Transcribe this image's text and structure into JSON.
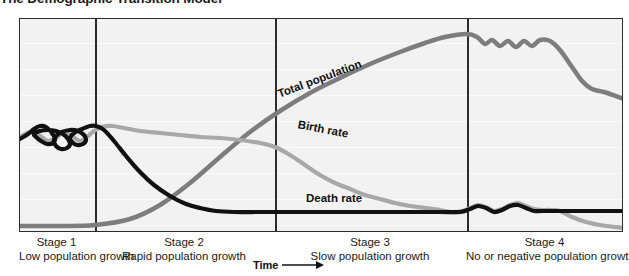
{
  "title": "The Demographic Transition Model",
  "axis": {
    "x_label": "Time",
    "x_arrow_icon": "right-arrow-icon"
  },
  "curve_labels": {
    "total_population": "Total population",
    "birth_rate": "Birth rate",
    "death_rate": "Death rate"
  },
  "stages": [
    {
      "name": "Stage 1",
      "description": "Low population growth"
    },
    {
      "name": "Stage 2",
      "description": "Rapid population growth"
    },
    {
      "name": "Stage 3",
      "description": "Slow population growth"
    },
    {
      "name": "Stage 4",
      "description": "No or negative population growth"
    }
  ],
  "colors": {
    "total_population": "#7d7d7d",
    "birth_rate": "#a8a8a8",
    "death_rate": "#111111",
    "plot_background": "#f2f2f2",
    "frame": "#2b2b2b",
    "gridline": "#fbfbfb"
  },
  "chart_data": {
    "type": "line",
    "title": "The Demographic Transition Model",
    "xlabel": "Time",
    "ylabel": "",
    "grid": true,
    "legend": "inline-curve-labels",
    "xlim": [
      0,
      604
    ],
    "ylim": [
      214,
      0
    ],
    "stage_boundaries_px": [
      75,
      255,
      447
    ],
    "series": [
      {
        "name": "Total population",
        "color": "#7d7d7d",
        "width": 4.5,
        "points": [
          [
            0,
            207
          ],
          [
            40,
            207
          ],
          [
            75,
            206
          ],
          [
            110,
            200
          ],
          [
            140,
            186
          ],
          [
            170,
            164
          ],
          [
            200,
            138
          ],
          [
            230,
            113
          ],
          [
            260,
            92
          ],
          [
            290,
            74
          ],
          [
            320,
            59
          ],
          [
            350,
            45
          ],
          [
            380,
            33
          ],
          [
            405,
            24
          ],
          [
            425,
            18
          ],
          [
            447,
            15
          ],
          [
            457,
            18
          ],
          [
            465,
            25
          ],
          [
            472,
            21
          ],
          [
            480,
            27
          ],
          [
            488,
            22
          ],
          [
            496,
            28
          ],
          [
            504,
            22
          ],
          [
            512,
            27
          ],
          [
            520,
            21
          ],
          [
            530,
            22
          ],
          [
            540,
            31
          ],
          [
            552,
            48
          ],
          [
            562,
            62
          ],
          [
            572,
            70
          ],
          [
            584,
            73
          ],
          [
            604,
            80
          ]
        ]
      },
      {
        "name": "Birth rate",
        "color": "#a8a8a8",
        "width": 4.2,
        "points": [
          [
            0,
            118
          ],
          [
            10,
            113
          ],
          [
            20,
            117
          ],
          [
            28,
            122
          ],
          [
            36,
            119
          ],
          [
            44,
            113
          ],
          [
            52,
            117
          ],
          [
            60,
            122
          ],
          [
            68,
            117
          ],
          [
            74,
            112
          ],
          [
            82,
            108
          ],
          [
            92,
            107
          ],
          [
            104,
            109
          ],
          [
            120,
            112
          ],
          [
            140,
            114
          ],
          [
            160,
            116
          ],
          [
            180,
            118
          ],
          [
            200,
            119
          ],
          [
            220,
            121
          ],
          [
            240,
            124
          ],
          [
            255,
            128
          ],
          [
            270,
            136
          ],
          [
            285,
            146
          ],
          [
            300,
            156
          ],
          [
            315,
            164
          ],
          [
            330,
            170
          ],
          [
            345,
            176
          ],
          [
            360,
            180
          ],
          [
            375,
            184
          ],
          [
            390,
            187
          ],
          [
            405,
            189
          ],
          [
            420,
            191
          ],
          [
            432,
            193
          ],
          [
            442,
            192
          ],
          [
            450,
            189
          ],
          [
            458,
            186
          ],
          [
            466,
            188
          ],
          [
            474,
            192
          ],
          [
            482,
            190
          ],
          [
            490,
            186
          ],
          [
            498,
            184
          ],
          [
            506,
            187
          ],
          [
            514,
            190
          ],
          [
            522,
            191
          ],
          [
            530,
            191
          ],
          [
            540,
            192
          ],
          [
            552,
            198
          ],
          [
            566,
            203
          ],
          [
            580,
            206
          ],
          [
            604,
            209
          ]
        ]
      },
      {
        "name": "Death rate",
        "color": "#111111",
        "width": 4.2,
        "points": [
          [
            0,
            120
          ],
          [
            8,
            115
          ],
          [
            14,
            110
          ],
          [
            20,
            107
          ],
          [
            26,
            108
          ],
          [
            31,
            113
          ],
          [
            35,
            119
          ],
          [
            33,
            124
          ],
          [
            27,
            125
          ],
          [
            21,
            122
          ],
          [
            16,
            118
          ],
          [
            14,
            115
          ],
          [
            20,
            112
          ],
          [
            28,
            111
          ],
          [
            36,
            112
          ],
          [
            43,
            115
          ],
          [
            48,
            120
          ],
          [
            50,
            125
          ],
          [
            47,
            129
          ],
          [
            41,
            130
          ],
          [
            36,
            127
          ],
          [
            34,
            122
          ],
          [
            36,
            117
          ],
          [
            42,
            113
          ],
          [
            50,
            111
          ],
          [
            58,
            112
          ],
          [
            64,
            116
          ],
          [
            66,
            121
          ],
          [
            63,
            125
          ],
          [
            57,
            126
          ],
          [
            52,
            123
          ],
          [
            50,
            119
          ],
          [
            54,
            114
          ],
          [
            62,
            110
          ],
          [
            70,
            107
          ],
          [
            76,
            107
          ],
          [
            84,
            111
          ],
          [
            94,
            122
          ],
          [
            106,
            137
          ],
          [
            120,
            153
          ],
          [
            134,
            166
          ],
          [
            150,
            177
          ],
          [
            166,
            185
          ],
          [
            180,
            189
          ],
          [
            196,
            192
          ],
          [
            214,
            193
          ],
          [
            240,
            193
          ],
          [
            270,
            193
          ],
          [
            300,
            193
          ],
          [
            330,
            193
          ],
          [
            360,
            193
          ],
          [
            390,
            193
          ],
          [
            420,
            193
          ],
          [
            440,
            193
          ],
          [
            450,
            190
          ],
          [
            458,
            187
          ],
          [
            466,
            189
          ],
          [
            474,
            193
          ],
          [
            482,
            191
          ],
          [
            490,
            187
          ],
          [
            498,
            186
          ],
          [
            506,
            189
          ],
          [
            514,
            192
          ],
          [
            522,
            192
          ],
          [
            534,
            192
          ],
          [
            550,
            192
          ],
          [
            570,
            192
          ],
          [
            604,
            192
          ]
        ]
      }
    ]
  }
}
